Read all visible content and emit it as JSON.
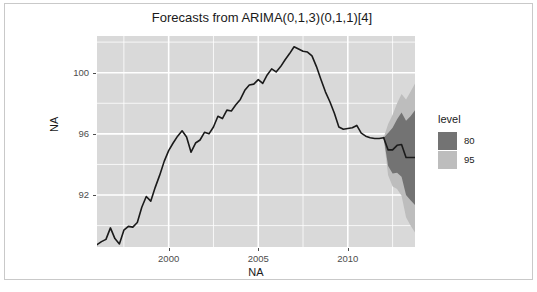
{
  "chart_data": {
    "type": "line",
    "title": "Forecasts from ARIMA(0,1,3)(0,1,1)[4]",
    "xlabel": "NA",
    "ylabel": "NA",
    "xlim": [
      1996.0,
      2013.75
    ],
    "ylim": [
      88.6,
      102.4
    ],
    "xticks": [
      2000,
      2005,
      2010
    ],
    "xtick_labels": [
      "2000",
      "2005",
      "2010"
    ],
    "yticks": [
      92,
      96,
      100
    ],
    "ytick_labels": [
      "92",
      "96",
      "100"
    ],
    "grid": true,
    "panel_background": "#d9d9d9",
    "gridline_color": "#ffffff",
    "series": [
      {
        "name": "observed",
        "color": "#1a1a1a",
        "x": [
          1996.0,
          1996.25,
          1996.5,
          1996.75,
          1997.0,
          1997.25,
          1997.5,
          1997.75,
          1998.0,
          1998.25,
          1998.5,
          1998.75,
          1999.0,
          1999.25,
          1999.5,
          1999.75,
          2000.0,
          2000.25,
          2000.5,
          2000.75,
          2001.0,
          2001.25,
          2001.5,
          2001.75,
          2002.0,
          2002.25,
          2002.5,
          2002.75,
          2003.0,
          2003.25,
          2003.5,
          2003.75,
          2004.0,
          2004.25,
          2004.5,
          2004.75,
          2005.0,
          2005.25,
          2005.5,
          2005.75,
          2006.0,
          2006.25,
          2006.5,
          2006.75,
          2007.0,
          2007.25,
          2007.5,
          2007.75,
          2008.0,
          2008.25,
          2008.5,
          2008.75,
          2009.0,
          2009.25,
          2009.5,
          2009.75,
          2010.0,
          2010.25,
          2010.5,
          2010.75,
          2011.0,
          2011.25,
          2011.5,
          2011.75,
          2012.0
        ],
        "y": [
          88.75,
          88.95,
          89.1,
          89.85,
          89.15,
          88.8,
          89.7,
          89.95,
          89.9,
          90.2,
          91.2,
          91.9,
          91.6,
          92.5,
          93.3,
          94.2,
          94.9,
          95.4,
          95.85,
          96.2,
          95.8,
          94.8,
          95.4,
          95.6,
          96.1,
          96.0,
          96.45,
          97.15,
          97.0,
          97.55,
          97.5,
          97.9,
          98.25,
          98.85,
          99.2,
          99.25,
          99.55,
          99.3,
          99.85,
          100.25,
          100.05,
          100.4,
          100.85,
          101.25,
          101.7,
          101.55,
          101.4,
          101.35,
          101.1,
          100.4,
          99.55,
          98.75,
          98.1,
          97.35,
          96.45,
          96.3,
          96.35,
          96.4,
          96.55,
          96.05,
          95.85,
          95.75,
          95.7,
          95.7,
          95.75
        ]
      },
      {
        "name": "forecast-mean",
        "color": "#1a1a1a",
        "x": [
          2012.0,
          2012.25,
          2012.5,
          2012.75,
          2013.0,
          2013.25,
          2013.5,
          2013.75
        ],
        "y": [
          95.75,
          94.95,
          94.95,
          95.25,
          95.3,
          94.45,
          94.45,
          94.45
        ]
      }
    ],
    "intervals": [
      {
        "level": 80,
        "color": "#737373",
        "x": [
          2012.0,
          2012.25,
          2012.5,
          2012.75,
          2013.0,
          2013.25,
          2013.5,
          2013.75
        ],
        "lower": [
          95.75,
          93.9,
          93.4,
          93.45,
          93.2,
          92.0,
          91.65,
          91.35
        ],
        "upper": [
          95.75,
          96.05,
          96.4,
          96.95,
          97.4,
          96.85,
          97.15,
          97.55
        ]
      },
      {
        "level": 95,
        "color": "#bdbdbd",
        "x": [
          2012.0,
          2012.25,
          2012.5,
          2012.75,
          2013.0,
          2013.25,
          2013.5,
          2013.75
        ],
        "lower": [
          95.75,
          93.3,
          92.55,
          92.4,
          91.95,
          90.55,
          90.0,
          89.55
        ],
        "upper": [
          95.75,
          96.65,
          97.25,
          98.0,
          98.6,
          98.25,
          98.75,
          99.3
        ]
      }
    ]
  },
  "legend": {
    "title": "level",
    "items": [
      {
        "label": "80",
        "color": "#737373"
      },
      {
        "label": "95",
        "color": "#bdbdbd"
      }
    ]
  }
}
